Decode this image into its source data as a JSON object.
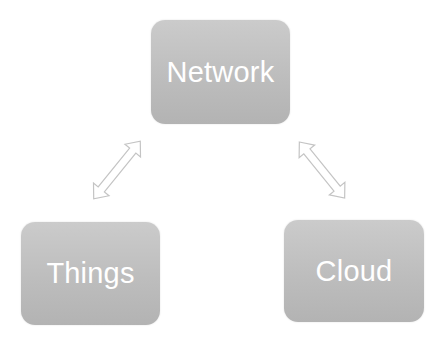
{
  "diagram": {
    "nodes": [
      {
        "id": "network",
        "label": "Network"
      },
      {
        "id": "things",
        "label": "Things"
      },
      {
        "id": "cloud",
        "label": "Cloud"
      }
    ],
    "edges": [
      {
        "from": "things",
        "to": "network",
        "type": "bidirectional-arrow"
      },
      {
        "from": "network",
        "to": "cloud",
        "type": "bidirectional-arrow"
      }
    ],
    "colors": {
      "node_fill": "#bdbdbd",
      "node_text": "#ffffff",
      "arrow_stroke": "#c8c8c8",
      "background": "#ffffff"
    }
  }
}
